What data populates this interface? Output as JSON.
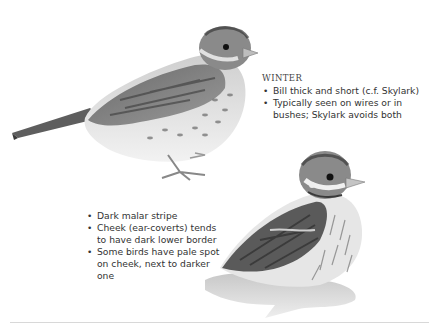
{
  "plate": {
    "winter_note": {
      "heading": "WINTER",
      "bullets": [
        "Bill thick and short (c.f. Skylark)",
        "Typically seen on wires or in bushes; Skylark avoids both"
      ]
    },
    "head_note": {
      "bullets": [
        "Dark malar stripe",
        "Cheek (ear-coverts) tends to have dark lower border",
        "Some birds have pale spot on cheek, next to darker one"
      ]
    },
    "illustrations": [
      {
        "name": "standing-bird",
        "pose": "side view, standing"
      },
      {
        "name": "crouching-bird",
        "pose": "crouched on snow"
      }
    ]
  },
  "colors": {
    "background": "#ffffff",
    "text": "#333333",
    "rule": "#d8d8d8"
  }
}
